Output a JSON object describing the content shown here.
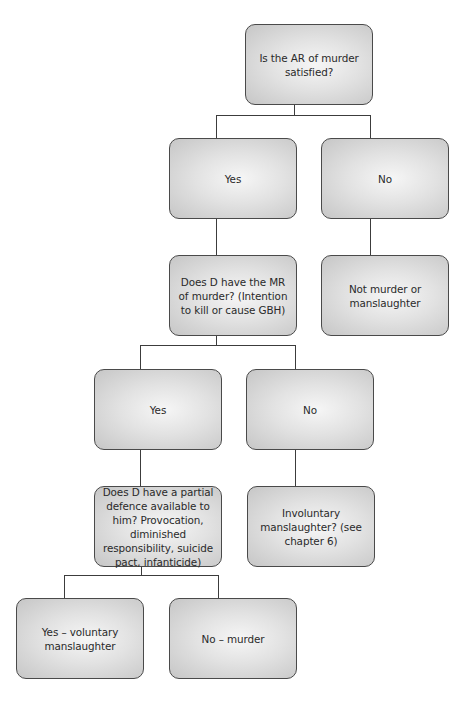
{
  "diagram": {
    "type": "decision-tree",
    "nodes": {
      "q_ar": {
        "text": "Is the AR of murder satisfied?"
      },
      "ar_yes": {
        "text": "Yes"
      },
      "ar_no": {
        "text": "No"
      },
      "q_mr": {
        "text": "Does D have the MR of murder? (Intention to kill or cause GBH)"
      },
      "not_murder": {
        "text": "Not murder or manslaughter"
      },
      "mr_yes": {
        "text": "Yes"
      },
      "mr_no": {
        "text": "No"
      },
      "q_defence": {
        "text": "Does D have a partial defence available to him? Provocation, diminished responsibility, suicide pact, infanticide)"
      },
      "involuntary": {
        "text": "Involuntary manslaughter? (see chapter 6)"
      },
      "def_yes": {
        "text": "Yes – voluntary manslaughter"
      },
      "def_no": {
        "text": "No – murder"
      }
    },
    "edges": [
      [
        "q_ar",
        "ar_yes"
      ],
      [
        "q_ar",
        "ar_no"
      ],
      [
        "ar_yes",
        "q_mr"
      ],
      [
        "ar_no",
        "not_murder"
      ],
      [
        "q_mr",
        "mr_yes"
      ],
      [
        "q_mr",
        "mr_no"
      ],
      [
        "mr_yes",
        "q_defence"
      ],
      [
        "mr_no",
        "involuntary"
      ],
      [
        "q_defence",
        "def_yes"
      ],
      [
        "q_defence",
        "def_no"
      ]
    ],
    "colors": {
      "border": "#4a4a4a",
      "fill_center": "#f6f6f6",
      "fill_edge": "#c6c6c6",
      "connector": "#3c3c3c",
      "text": "#2a2a2a"
    }
  }
}
